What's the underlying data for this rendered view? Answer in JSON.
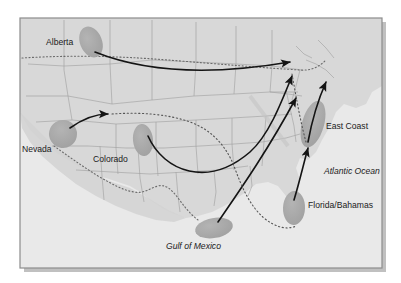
{
  "figure": {
    "kind": "map",
    "title": "",
    "region": "North America",
    "frame": {
      "x": 20,
      "y": 18,
      "width": 362,
      "height": 250
    }
  },
  "colors": {
    "page_background": "#ffffff",
    "ocean": "#e8e8e8",
    "land": "#d9d9d9",
    "land_shadow": "#cfcfcf",
    "state_border": "#9a9a9a",
    "country_border_dotted": "#6e6e6e",
    "source_blob": "#a8a8a8",
    "arrow": "#141414",
    "frame_border": "#8c8c8c",
    "frame_shadow": "#c0c0c0",
    "label_text": "#1b1b1b"
  },
  "labels": [
    {
      "id": "alberta",
      "text": "Alberta",
      "x": 46,
      "y": 45,
      "style": "plain",
      "anchor": "start"
    },
    {
      "id": "nevada",
      "text": "Nevada",
      "x": 22,
      "y": 152,
      "style": "plain",
      "anchor": "start"
    },
    {
      "id": "colorado",
      "text": "Colorado",
      "x": 93,
      "y": 162,
      "style": "plain",
      "anchor": "start"
    },
    {
      "id": "east-coast",
      "text": "East Coast",
      "x": 326,
      "y": 129,
      "style": "plain",
      "anchor": "start"
    },
    {
      "id": "florida-bahamas",
      "text": "Florida/Bahamas",
      "x": 308,
      "y": 208,
      "style": "plain",
      "anchor": "start"
    },
    {
      "id": "atlantic-ocean",
      "text": "Atlantic Ocean",
      "x": 324,
      "y": 174,
      "style": "italic",
      "anchor": "start"
    },
    {
      "id": "gulf-of-mexico",
      "text": "Gulf of Mexico",
      "x": 166,
      "y": 249,
      "style": "italic",
      "anchor": "start"
    }
  ],
  "source_regions": [
    {
      "id": "alberta-blob",
      "label": "Alberta",
      "cx": 91,
      "cy": 42,
      "rx": 11,
      "ry": 16,
      "rotation": -22
    },
    {
      "id": "nevada-blob",
      "label": "Nevada",
      "cx": 63,
      "cy": 134,
      "rx": 14,
      "ry": 14,
      "rotation": 12
    },
    {
      "id": "colorado-blob",
      "label": "Colorado",
      "cx": 143,
      "cy": 140,
      "rx": 10,
      "ry": 16,
      "rotation": -6
    },
    {
      "id": "east-coast-blob",
      "label": "East Coast",
      "cx": 313,
      "cy": 124,
      "rx": 11,
      "ry": 24,
      "rotation": 16
    },
    {
      "id": "florida-bahamas-blob",
      "label": "Florida/Bahamas",
      "cx": 294,
      "cy": 208,
      "rx": 11,
      "ry": 17,
      "rotation": 2
    },
    {
      "id": "gulf-blob",
      "label": "Gulf of Mexico",
      "cx": 214,
      "cy": 228,
      "rx": 19,
      "ry": 10,
      "rotation": -10
    }
  ],
  "trajectories": [
    {
      "id": "alberta-to-northeast",
      "from": "Alberta",
      "to": "Northeast",
      "kind": "solid-arrow"
    },
    {
      "id": "nevada-to-east",
      "from": "Nevada",
      "to": "Plains",
      "kind": "solid-arrow"
    },
    {
      "id": "colorado-to-northeast",
      "from": "Colorado",
      "to": "Northeast",
      "kind": "solid-arrow"
    },
    {
      "id": "gulf-to-northeast",
      "from": "Gulf of Mexico",
      "to": "Northeast",
      "kind": "solid-arrow"
    },
    {
      "id": "eastcoast-to-northeast",
      "from": "East Coast",
      "to": "Northeast",
      "kind": "solid-arrow"
    },
    {
      "id": "florida-to-eastcoast",
      "from": "Florida/Bahamas",
      "to": "East Coast",
      "kind": "solid-arrow"
    },
    {
      "id": "gulf-dotted-to-florida",
      "from": "Gulf of Mexico",
      "to": "Florida/Bahamas",
      "kind": "dotted-path"
    }
  ]
}
